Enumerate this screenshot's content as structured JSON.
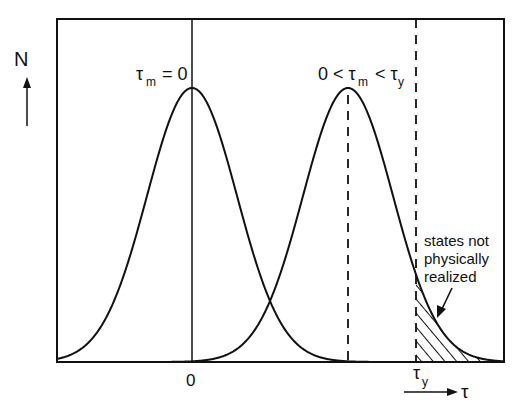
{
  "figure": {
    "type": "diagram",
    "colors": {
      "ink": "#111111",
      "background": "#ffffff"
    },
    "y_axis": {
      "label": "N",
      "arrow": "up-arrow"
    },
    "x_axis": {
      "label": "τ",
      "arrow": "right-arrow",
      "tick_zero": "0",
      "tick_yield_main": "τ",
      "tick_yield_sub": "y"
    },
    "curves": [
      {
        "name": "left-gaussian",
        "center_label_main": "τ",
        "center_label_sub": "m",
        "center_label_rest": " = 0",
        "center_px": 192,
        "sigma_px": 45,
        "line": "solid"
      },
      {
        "name": "right-gaussian",
        "center_label_prefix": "0 < τ",
        "center_label_sub": "m",
        "center_label_mid": " < τ",
        "center_label_sub2": "y",
        "center_px": 348,
        "sigma_px": 45,
        "line": "dashed-center"
      }
    ],
    "annotation": {
      "lines": [
        "states not",
        "physically",
        "realized"
      ],
      "target": "hatched-tail-region"
    }
  }
}
